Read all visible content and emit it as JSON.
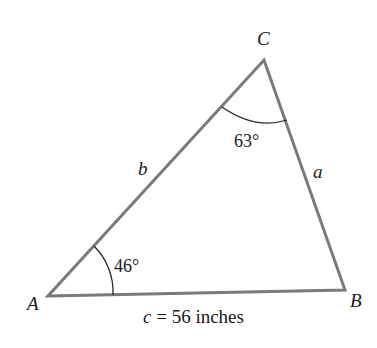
{
  "figure": {
    "type": "triangle",
    "vertices": {
      "A": {
        "label": "A",
        "x": 48,
        "y": 296
      },
      "B": {
        "label": "B",
        "x": 345,
        "y": 290
      },
      "C": {
        "label": "C",
        "x": 264,
        "y": 60
      }
    },
    "sides": {
      "a": {
        "label": "a"
      },
      "b": {
        "label": "b"
      },
      "c": {
        "label_var": "c",
        "label_rest": " = 56 inches"
      }
    },
    "angles": {
      "A": {
        "label": "46°"
      },
      "C": {
        "label": "63°"
      }
    },
    "colors": {
      "line": "#7a7a7a",
      "arc": "#2a2a2a",
      "text": "#1a1a1a"
    }
  }
}
